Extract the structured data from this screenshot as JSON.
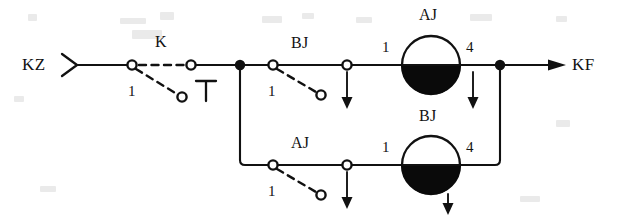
{
  "diagram": {
    "ink_color": "#111111",
    "background_color": "#ffffff",
    "terminals": {
      "input_label": "KZ",
      "output_label": "KF"
    },
    "upper_branch": {
      "switch_label": "K",
      "switch_pin": "1",
      "second_switch_label": "BJ",
      "second_switch_pin": "1",
      "coil_label": "AJ",
      "coil_pin_left": "1",
      "coil_pin_right": "4"
    },
    "lower_branch": {
      "switch_label": "AJ",
      "switch_pin": "1",
      "coil_label": "BJ",
      "coil_pin_left": "1",
      "coil_pin_right": "4"
    }
  },
  "labels": {
    "kz": "KZ",
    "kf": "KF",
    "k": "K",
    "k_pin": "1",
    "bj_switch": "BJ",
    "bj_switch_pin": "1",
    "aj_coil": "AJ",
    "aj_coil_pin_left": "1",
    "aj_coil_pin_right": "4",
    "aj_switch": "AJ",
    "aj_switch_pin": "1",
    "bj_coil": "BJ",
    "bj_coil_pin_left": "1",
    "bj_coil_pin_right": "4"
  }
}
